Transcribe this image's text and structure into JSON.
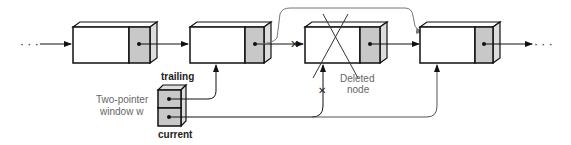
{
  "diagram": {
    "labels": {
      "trailing": "trailing",
      "current": "current",
      "window_line1": "Two-pointer",
      "window_line2": "window w",
      "deleted_line1": "Deleted",
      "deleted_line2": "node"
    },
    "ellipsis_left": "· · ·",
    "ellipsis_right": "· · ·",
    "nodes": [
      {
        "id": "node-1",
        "deleted": false
      },
      {
        "id": "node-2",
        "deleted": false
      },
      {
        "id": "node-3",
        "deleted": true
      },
      {
        "id": "node-4",
        "deleted": false
      }
    ],
    "colors": {
      "line": "#111111",
      "pointer_fill": "#c8c8c8",
      "node_fill": "#ffffff",
      "gray_line": "#888888"
    }
  }
}
